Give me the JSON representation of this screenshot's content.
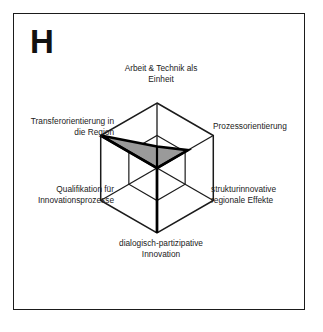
{
  "figure": {
    "panel_letter": "H",
    "background_color": "#ffffff",
    "frame_color": "#1b1b1b"
  },
  "chart_data": {
    "type": "radar",
    "title": "H",
    "xlabel": "",
    "ylabel": "",
    "grid": true,
    "legend_position": "none",
    "rings": [
      0.5,
      1.0
    ],
    "rmax": 1.0,
    "rmin": 0.0,
    "orientation": "pointy-top",
    "fill_color": "#9a9a9a",
    "stroke_color": "#000000",
    "grid_color": "#1b1b1b",
    "categories": [
      "Arbeit & Technik als Einheit",
      "Prozessorientierung",
      "strukturinnovative regionale Effekte",
      "dialogisch-partizipative Innovation",
      "Qualifikation für Innovationsprozesse",
      "Transferorientierung in die Region"
    ],
    "values": [
      0.33,
      0.55,
      0.0,
      1.0,
      0.0,
      1.0
    ],
    "series": [
      {
        "name": "H",
        "values": [
          0.33,
          0.55,
          0.0,
          1.0,
          0.0,
          1.0
        ]
      }
    ]
  },
  "axis_labels": {
    "top": {
      "line1": "Arbeit & Technik als",
      "line2": "Einheit"
    },
    "upper_right": {
      "line1": "Prozessorientierung",
      "line2": ""
    },
    "lower_right": {
      "line1": "strukturinnovative",
      "line2": "regionale Effekte"
    },
    "bottom": {
      "line1": "dialogisch-partizipative",
      "line2": "Innovation"
    },
    "lower_left": {
      "line1": "Qualifikation für",
      "line2": "Innovationsprozesse"
    },
    "upper_left": {
      "line1": "Transferorientierung in",
      "line2": "die Region"
    }
  }
}
